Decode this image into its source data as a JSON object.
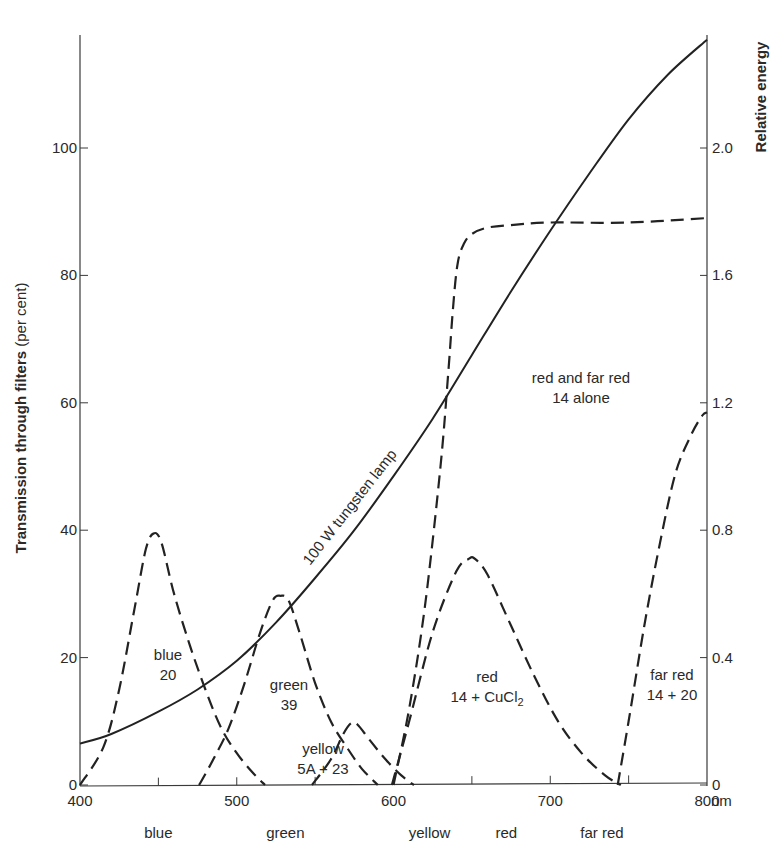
{
  "chart_data": {
    "type": "line",
    "title": "",
    "xlabel": "nm",
    "ylabel": "Transmission through filters (per cent)",
    "ylabel_bold": "Transmission through filters",
    "ylabel_light": "(per cent)",
    "y2label": "Relative energy",
    "xlim": [
      400,
      800
    ],
    "ylim": [
      0,
      118
    ],
    "y2lim": [
      0,
      2.36
    ],
    "grid": false,
    "legend": "none (curves labelled inline)",
    "x_ticks": [
      400,
      500,
      600,
      700,
      800
    ],
    "x_tick_labels": [
      "400",
      "500",
      "600",
      "700",
      "800"
    ],
    "x_minor_ticks": [
      450,
      550,
      650,
      750
    ],
    "x_unit_label": "nm",
    "y_ticks": [
      0,
      20,
      40,
      60,
      80,
      100
    ],
    "y_tick_labels": [
      "0",
      "20",
      "40",
      "60",
      "80",
      "100"
    ],
    "y2_ticks": [
      0,
      0.4,
      0.8,
      1.2,
      1.6,
      2.0
    ],
    "y2_tick_labels": [
      "0",
      "0.4",
      "0.8",
      "1.2",
      "1.6",
      "2.0"
    ],
    "band_labels": [
      {
        "text": "blue",
        "x": 450
      },
      {
        "text": "green",
        "x": 531
      },
      {
        "text": "yellow",
        "x": 623
      },
      {
        "text": "red",
        "x": 672
      },
      {
        "text": "far red",
        "x": 733
      }
    ],
    "series": [
      {
        "name": "100 W tungsten lamp",
        "axis": "right",
        "style": "solid",
        "x": [
          400,
          420,
          450,
          475,
          500,
          525,
          550,
          575,
          600,
          625,
          650,
          675,
          700,
          725,
          750,
          775,
          800
        ],
        "values": [
          0.13,
          0.16,
          0.23,
          0.3,
          0.39,
          0.51,
          0.65,
          0.8,
          0.97,
          1.15,
          1.35,
          1.55,
          1.74,
          1.92,
          2.09,
          2.23,
          2.34
        ]
      },
      {
        "name": "blue 20",
        "axis": "left",
        "style": "dashed",
        "x": [
          400,
          415,
          425,
          435,
          442,
          447,
          452,
          460,
          470,
          480,
          490,
          500,
          510,
          518
        ],
        "values": [
          0,
          6,
          15,
          28,
          37,
          39.5,
          38,
          30,
          22,
          15,
          9,
          5,
          2,
          0
        ]
      },
      {
        "name": "green 39",
        "axis": "left",
        "style": "dashed",
        "x": [
          476,
          485,
          495,
          505,
          515,
          523,
          528,
          533,
          540,
          550,
          560,
          570,
          580,
          590
        ],
        "values": [
          0,
          4,
          9,
          16,
          24,
          29,
          29.7,
          29,
          24,
          16,
          10,
          6,
          2.5,
          0
        ]
      },
      {
        "name": "yellow 5A + 23",
        "axis": "left",
        "style": "dashed",
        "x": [
          548,
          560,
          568,
          573,
          577,
          585,
          595,
          605,
          613
        ],
        "values": [
          0,
          4,
          8,
          9.7,
          9.5,
          7,
          4,
          1.5,
          0
        ]
      },
      {
        "name": "red and far red 14 alone",
        "axis": "left",
        "style": "dashed",
        "x": [
          600,
          610,
          620,
          630,
          635,
          638,
          641,
          645,
          650,
          660,
          680,
          700,
          750,
          800
        ],
        "values": [
          0,
          12,
          28,
          50,
          65,
          75,
          82,
          85,
          86.5,
          87.5,
          88,
          88.3,
          88.3,
          89
        ]
      },
      {
        "name": "red 14 + CuCl2",
        "axis": "left",
        "style": "dashed",
        "x": [
          599,
          610,
          625,
          640,
          648,
          652,
          660,
          675,
          690,
          705,
          720,
          735,
          745
        ],
        "values": [
          0,
          10,
          24,
          33.5,
          35.5,
          35.5,
          33,
          25,
          17,
          10,
          5,
          1.5,
          0
        ]
      },
      {
        "name": "far red 14 + 20",
        "axis": "left",
        "style": "dashed",
        "x": [
          743,
          750,
          760,
          770,
          780,
          790,
          797,
          800
        ],
        "values": [
          0,
          10,
          25,
          38,
          49,
          55,
          58,
          58.5
        ]
      }
    ],
    "annotations": [
      {
        "text": "100 W tungsten lamp",
        "x": 570,
        "y": 40,
        "rotation": -52
      },
      {
        "text_lines": [
          "blue",
          "20"
        ],
        "x": 460,
        "y": 19
      },
      {
        "text_lines": [
          "green",
          "39"
        ],
        "x": 534,
        "y": 14
      },
      {
        "text_lines": [
          "yellow",
          "5A + 23"
        ],
        "x": 564,
        "y": 5
      },
      {
        "text_lines": [
          "red and far red",
          "14 alone"
        ],
        "x": 695,
        "y": 61
      },
      {
        "text_lines": [
          "red",
          "14 + CuCl2"
        ],
        "x": 670,
        "y": 17
      },
      {
        "text_lines": [
          "far red",
          "14 + 20"
        ],
        "x": 778,
        "y": 18
      }
    ]
  },
  "labels": {
    "lamp": "100 W tungsten lamp",
    "blue_name": "blue",
    "blue_num": "20",
    "green_name": "green",
    "green_num": "39",
    "yellow_name": "yellow",
    "yellow_num": "5A + 23",
    "redfar_name": "red and far red",
    "redfar_num": "14 alone",
    "red_name": "red",
    "red_num_prefix": "14 + CuCl",
    "red_num_sub": "2",
    "farred_name": "far red",
    "farred_num": "14 + 20"
  }
}
